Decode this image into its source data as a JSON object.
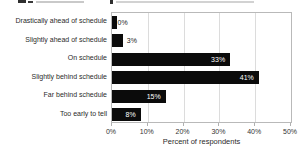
{
  "chart_data": {
    "type": "bar",
    "orientation": "horizontal",
    "categories": [
      "Drastically ahead of schedule",
      "Slightly ahead of schedule",
      "On schedule",
      "Slightly behind schedule",
      "Far behind schedule",
      "Too early to tell"
    ],
    "values": [
      0,
      3,
      33,
      41,
      15,
      8
    ],
    "value_labels": [
      "0%",
      "3%",
      "33%",
      "41%",
      "15%",
      "8%"
    ],
    "xlabel": "Percent of respondents",
    "x_tick_values": [
      0,
      10,
      20,
      30,
      40,
      50
    ],
    "x_tick_labels": [
      "0%",
      "10%",
      "20%",
      "30%",
      "40%",
      "50%"
    ],
    "xlim": [
      0,
      50
    ],
    "grid": true,
    "legend": false,
    "bar_color": "#0b0b0b",
    "inside_label_color": "#ffffff",
    "outside_label_color": "#1d1d1d"
  }
}
